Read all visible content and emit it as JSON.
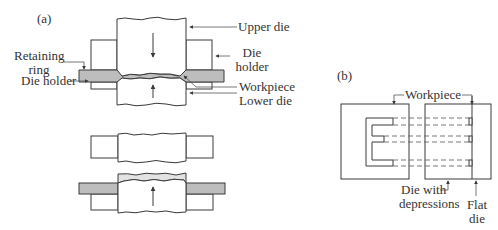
{
  "figure": {
    "panel_a": {
      "label": "(a)",
      "callouts": {
        "upper_die": "Upper die",
        "die_holder_right_line1": "Die",
        "die_holder_right_line2": "holder",
        "retaining_ring_line1": "Retaining",
        "retaining_ring_line2": "ring",
        "die_holder_left": "Die holder",
        "workpiece": "Workpiece",
        "lower_die": "Lower die"
      }
    },
    "panel_b": {
      "label": "(b)",
      "callouts": {
        "workpiece": "Workpiece",
        "die_with_depressions_line1": "Die with",
        "die_with_depressions_line2": "depressions",
        "flat_die_line1": "Flat",
        "flat_die_line2": "die"
      }
    },
    "colors": {
      "stroke": "#3a3a3a",
      "workpiece_fill": "#bdbdbd",
      "compressed_fill": "#e2e2e2",
      "background": "#ffffff"
    }
  }
}
